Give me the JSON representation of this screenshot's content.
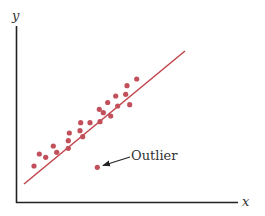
{
  "chart_data": {
    "type": "scatter",
    "title": "",
    "xlabel": "x",
    "ylabel": "y",
    "grid": false,
    "legend": null,
    "axis_ticks": false,
    "series": [
      {
        "name": "data points",
        "color": "#c2505a",
        "points": [
          [
            34,
            166
          ],
          [
            39.3,
            154
          ],
          [
            45.7,
            157.3
          ],
          [
            53.3,
            146
          ],
          [
            56.7,
            152.3
          ],
          [
            68.3,
            140.7
          ],
          [
            68.3,
            148.3
          ],
          [
            69.3,
            133
          ],
          [
            80.7,
            122.7
          ],
          [
            80,
            130.7
          ],
          [
            82.7,
            136.7
          ],
          [
            90,
            122.7
          ],
          [
            99.3,
            109.3
          ],
          [
            100,
            121.7
          ],
          [
            103.3,
            112.7
          ],
          [
            107.7,
            102.5
          ],
          [
            110.7,
            116
          ],
          [
            115.7,
            96
          ],
          [
            117.7,
            106
          ],
          [
            125.7,
            94.3
          ],
          [
            127,
            85.7
          ],
          [
            129.7,
            104.7
          ],
          [
            136.7,
            79
          ]
        ]
      },
      {
        "name": "outlier",
        "color": "#c2505a",
        "points": [
          [
            97.3,
            167.3
          ]
        ]
      }
    ],
    "trend_line": {
      "color": "#c0444a",
      "from": [
        24,
        184
      ],
      "to": [
        185,
        51
      ]
    },
    "annotations": [
      {
        "text": "Outlier",
        "x": 131,
        "y": 160,
        "arrow_to": [
          103,
          165.5
        ]
      }
    ],
    "note": "Coordinates are in pixel space of the figure (no numeric axis scale shown)."
  },
  "labels": {
    "x_axis": "x",
    "y_axis": "y",
    "outlier": "Outlier"
  }
}
